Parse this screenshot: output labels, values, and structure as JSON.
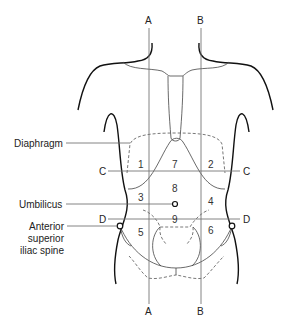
{
  "diagram": {
    "vertical_lines": [
      {
        "id": "A",
        "top_label": "A",
        "bottom_label": "A",
        "x": 149
      },
      {
        "id": "B",
        "top_label": "B",
        "bottom_label": "B",
        "x": 201
      }
    ],
    "horizontal_lines": [
      {
        "id": "C",
        "left_label": "C",
        "right_label": "C",
        "y": 171
      },
      {
        "id": "D",
        "left_label": "D",
        "right_label": "D",
        "y": 219
      }
    ],
    "regions": [
      {
        "number": "1",
        "x": 141,
        "y": 164
      },
      {
        "number": "7",
        "x": 175,
        "y": 164
      },
      {
        "number": "2",
        "x": 211,
        "y": 164
      },
      {
        "number": "8",
        "x": 175,
        "y": 189
      },
      {
        "number": "3",
        "x": 141,
        "y": 199
      },
      {
        "number": "4",
        "x": 211,
        "y": 203
      },
      {
        "number": "9",
        "x": 175,
        "y": 222
      },
      {
        "number": "5",
        "x": 141,
        "y": 236
      },
      {
        "number": "6",
        "x": 211,
        "y": 234
      }
    ],
    "annotations": {
      "diaphragm": "Diaphragm",
      "umbilicus": "Umbilicus",
      "asis_line1": "Anterior",
      "asis_line2": "superior",
      "asis_line3": "iliac spine"
    }
  }
}
